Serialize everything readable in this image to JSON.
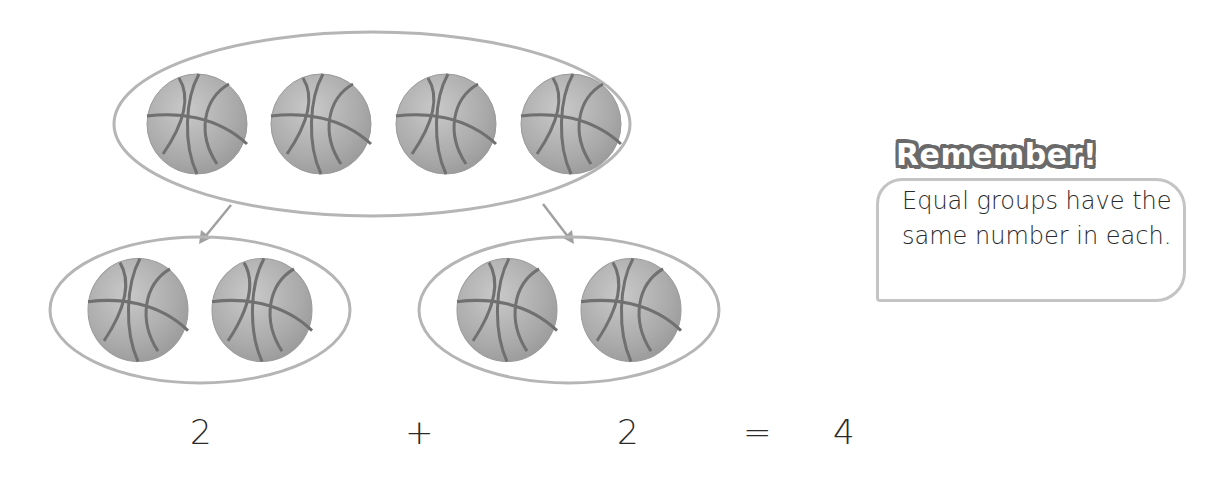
{
  "diagram": {
    "whole_group": {
      "count": 4,
      "object": "basketball"
    },
    "part_groups": [
      {
        "count": 2,
        "object": "basketball"
      },
      {
        "count": 2,
        "object": "basketball"
      }
    ],
    "arrows": [
      "left-arrow",
      "right-arrow"
    ]
  },
  "equation": {
    "addend1": "2",
    "plus": "+",
    "addend2": "2",
    "equals": "=",
    "sum": "4"
  },
  "callout": {
    "title": "Remember!",
    "body": "Equal groups have the same number in each."
  },
  "colors": {
    "ball_fill": "#b0b0b0",
    "ball_seam": "#707070",
    "outline": "#b5b5b5",
    "text": "#2a2a2a",
    "title_stroke": "#6a6a6a"
  }
}
